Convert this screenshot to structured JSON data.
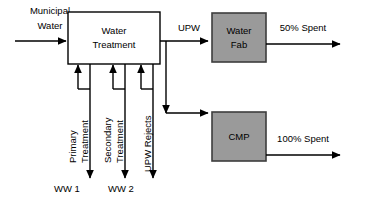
{
  "diagram": {
    "colors": {
      "background": "#ffffff",
      "line": "#000000",
      "plain_box_fill": "#ffffff",
      "shaded_box_fill": "#9a9a9a",
      "shaded_box_stroke": "#3d3d3d"
    },
    "nodes": [
      {
        "id": "water-treatment",
        "label_line1": "Water",
        "label_line2": "Treatment",
        "style": "plain"
      },
      {
        "id": "water-fab",
        "label_line1": "Water",
        "label_line2": "Fab",
        "style": "shaded"
      },
      {
        "id": "cmp",
        "label_line1": "CMP",
        "label_line2": "",
        "style": "shaded"
      }
    ],
    "edge_labels": {
      "municipal_water_line1": "Municipal",
      "municipal_water_line2": "Water",
      "upw": "UPW",
      "fab_output": "50% Spent",
      "cmp_output": "100% Spent"
    },
    "return_streams": [
      {
        "id": "primary-treatment",
        "label_line1": "Primary",
        "label_line2": "Treatment",
        "outfall": "WW 1"
      },
      {
        "id": "secondary-treatment",
        "label_line1": "Secondary",
        "label_line2": "Treatment",
        "outfall": "WW 2"
      },
      {
        "id": "upw-rejects",
        "label_line1": "UPW Rejects",
        "label_line2": "",
        "outfall": ""
      }
    ]
  }
}
